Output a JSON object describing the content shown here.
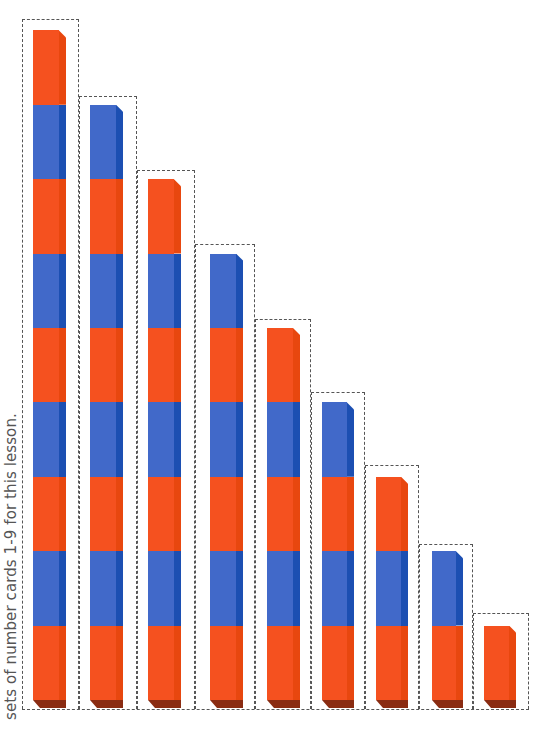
{
  "caption": "sets of number cards 1-9 for this lesson.",
  "colors": {
    "orange": "#f5511f",
    "blue": "#4169c9",
    "blue_side": "#1c4fb2",
    "bottom_face": "#8a2c12",
    "dash": "#555555"
  },
  "cube_pattern_from_bottom": [
    "orange",
    "blue"
  ],
  "columns": [
    {
      "count": 9,
      "box": {
        "x": 22,
        "y": 19,
        "w": 57
      },
      "bar": {
        "x": 33,
        "w": 33
      }
    },
    {
      "count": 8,
      "box": {
        "x": 79,
        "y": 96,
        "w": 58
      },
      "bar": {
        "x": 90,
        "w": 33
      }
    },
    {
      "count": 7,
      "box": {
        "x": 137,
        "y": 170,
        "w": 58
      },
      "bar": {
        "x": 148,
        "w": 33
      }
    },
    {
      "count": 6,
      "box": {
        "x": 195,
        "y": 244,
        "w": 60
      },
      "bar": {
        "x": 210,
        "w": 33
      }
    },
    {
      "count": 5,
      "box": {
        "x": 255,
        "y": 319,
        "w": 56
      },
      "bar": {
        "x": 267,
        "w": 33
      }
    },
    {
      "count": 4,
      "box": {
        "x": 311,
        "y": 392,
        "w": 54
      },
      "bar": {
        "x": 322,
        "w": 32
      }
    },
    {
      "count": 3,
      "box": {
        "x": 365,
        "y": 465,
        "w": 54
      },
      "bar": {
        "x": 376,
        "w": 32
      }
    },
    {
      "count": 2,
      "box": {
        "x": 419,
        "y": 544,
        "w": 54
      },
      "bar": {
        "x": 432,
        "w": 31
      }
    },
    {
      "count": 1,
      "box": {
        "x": 473,
        "y": 613,
        "w": 56
      },
      "bar": {
        "x": 484,
        "w": 32
      }
    }
  ],
  "geometry": {
    "bar_bottom": 700,
    "cube_height": 74.4,
    "side_width": 7,
    "bottom_face_height": 8
  }
}
